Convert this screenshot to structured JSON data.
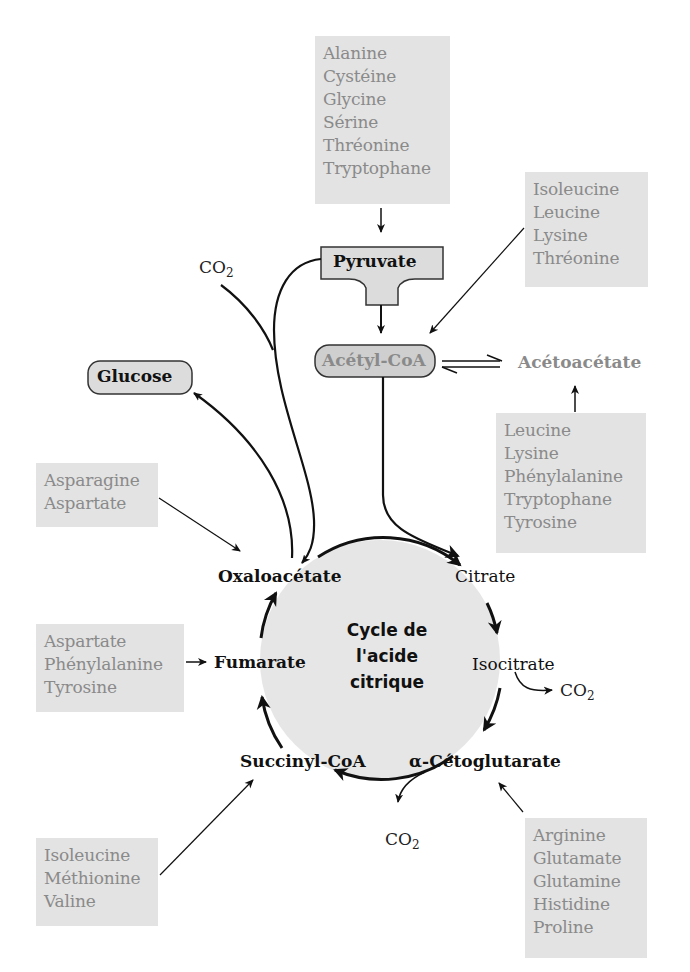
{
  "diagram": {
    "type": "metabolic-pathway",
    "cycle_title": [
      "Cycle de",
      "l'acide",
      "citrique"
    ],
    "nodes": {
      "pyruvate": "Pyruvate",
      "acetyl_coa": "Acétyl-CoA",
      "acetoacetate": "Acétoacétate",
      "glucose": "Glucose",
      "oxaloacetate": "Oxaloacétate",
      "citrate": "Citrate",
      "isocitrate": "Isocitrate",
      "alpha_ketoglutarate": "α-Cétoglutarate",
      "succinyl_coa": "Succinyl-CoA",
      "fumarate": "Fumarate"
    },
    "co2": {
      "main": "CO",
      "sub": "2"
    },
    "amino_acid_groups": {
      "to_pyruvate": [
        "Alanine",
        "Cystéine",
        "Glycine",
        "Sérine",
        "Thréonine",
        "Tryptophane"
      ],
      "to_acetyl_coa": [
        "Isoleucine",
        "Leucine",
        "Lysine",
        "Thréonine"
      ],
      "to_acetoacetate": [
        "Leucine",
        "Lysine",
        "Phénylalanine",
        "Tryptophane",
        "Tyrosine"
      ],
      "to_oxaloacetate": [
        "Asparagine",
        "Aspartate"
      ],
      "to_fumarate": [
        "Aspartate",
        "Phénylalanine",
        "Tyrosine"
      ],
      "to_succinyl_coa": [
        "Isoleucine",
        "Méthionine",
        "Valine"
      ],
      "to_alpha_ketoglutarate": [
        "Arginine",
        "Glutamate",
        "Glutamine",
        "Histidine",
        "Proline"
      ]
    },
    "colors": {
      "box_fill": "#e3e3e3",
      "box_text": "#8a8a8a",
      "node_fill": "#dcdcdc",
      "cycle_fill": "#e6e6e6",
      "line": "#111111"
    }
  }
}
